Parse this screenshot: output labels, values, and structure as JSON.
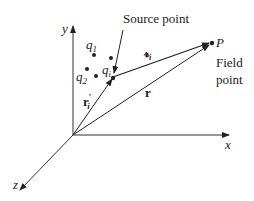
{
  "diagram": {
    "type": "3d-coordinate-vectors",
    "axes": {
      "x_label": "x",
      "y_label": "y",
      "z_label": "z"
    },
    "charges": {
      "q1": {
        "base": "q",
        "sub": "1"
      },
      "q2": {
        "base": "q",
        "sub": "2"
      },
      "qi": {
        "base": "q",
        "sub": "i"
      }
    },
    "source_point_label": "Source point",
    "field_point": {
      "name": "P",
      "line1": "Field",
      "line2": "point"
    },
    "vectors": {
      "r_prime": {
        "base": "r",
        "sub": "i",
        "prime": "′"
      },
      "r": {
        "base": "r"
      },
      "script_r": {
        "base": "𝓻",
        "sub": "i"
      }
    },
    "colors": {
      "ink": "#222222",
      "background": "#ffffff"
    }
  }
}
